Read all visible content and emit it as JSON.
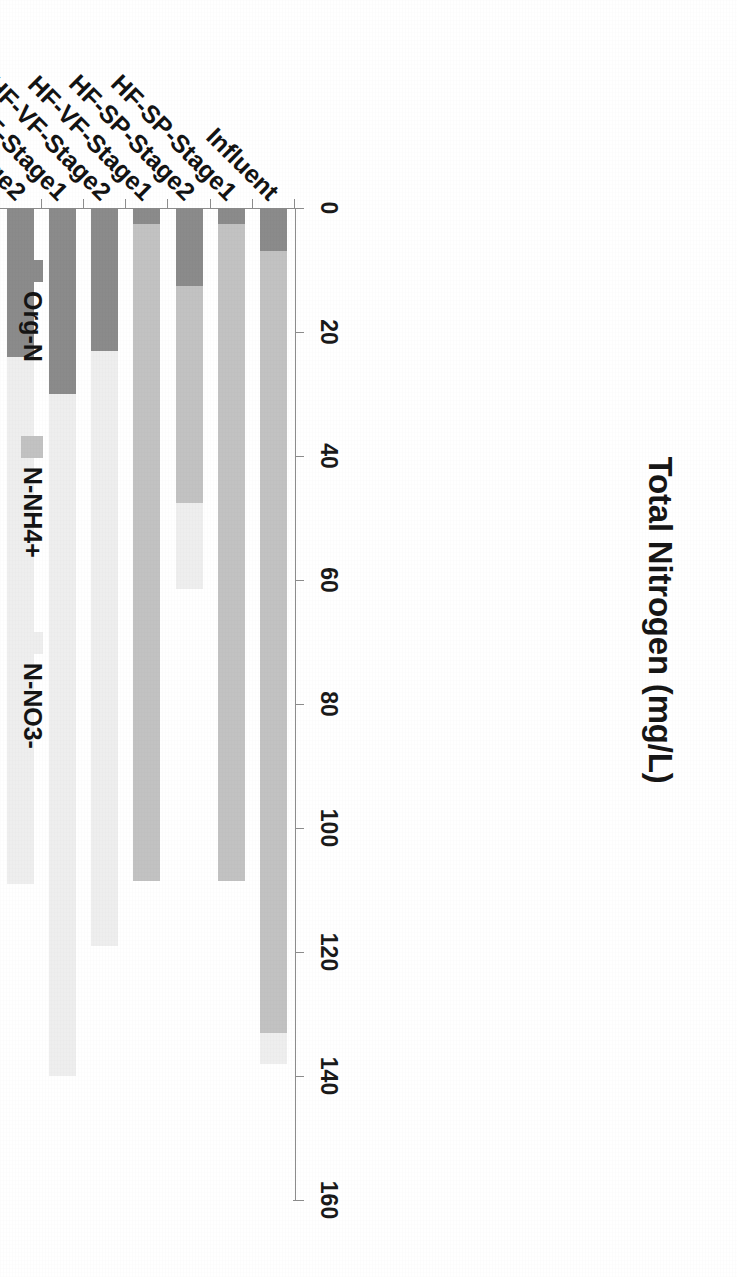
{
  "figure": {
    "title": "Total Nitrogen (mg/L)",
    "orientation": "rotated-90-clockwise"
  },
  "legend": {
    "position": "bottom-left",
    "items": [
      {
        "label": "Org-N",
        "color": "#8b8b8b"
      },
      {
        "label": "N-NH4+",
        "color": "#c2c2c2"
      },
      {
        "label": "N-NO3-",
        "color": "#eeeeee"
      }
    ]
  },
  "axis": {
    "label": "Total Nitrogen (mg/L)",
    "ticks": [
      "0",
      "20",
      "40",
      "60",
      "80",
      "100",
      "120",
      "140",
      "160"
    ],
    "min": 0,
    "max": 160,
    "step": 20
  },
  "chart_data": {
    "type": "bar",
    "subtype": "stacked-horizontal",
    "title": "Total Nitrogen (mg/L)",
    "xlabel": "Total Nitrogen (mg/L)",
    "ylabel": "",
    "xlim": [
      0,
      160
    ],
    "grid": false,
    "legend_position": "bottom-left",
    "categories": [
      "Influent",
      "HF-SP-Stage1",
      "HF-SP-Stage2",
      "HF-VF-Stage1",
      "HF-VF-Stage2",
      "VF-HF-Stage1",
      "VF-HF-Stage2"
    ],
    "series": [
      {
        "name": "Org-N",
        "color": "#8b8b8b",
        "values": [
          7,
          2.5,
          12.5,
          2.5,
          23,
          30,
          24
        ]
      },
      {
        "name": "N-NH4+",
        "color": "#c2c2c2",
        "values": [
          126,
          106,
          35,
          106,
          0,
          0,
          0
        ]
      },
      {
        "name": "N-NO3-",
        "color": "#eeeeee",
        "values": [
          5,
          0,
          14,
          0,
          96,
          110,
          85
        ]
      }
    ],
    "totals": [
      138,
      108.5,
      61.5,
      108.5,
      119,
      140,
      109
    ]
  }
}
